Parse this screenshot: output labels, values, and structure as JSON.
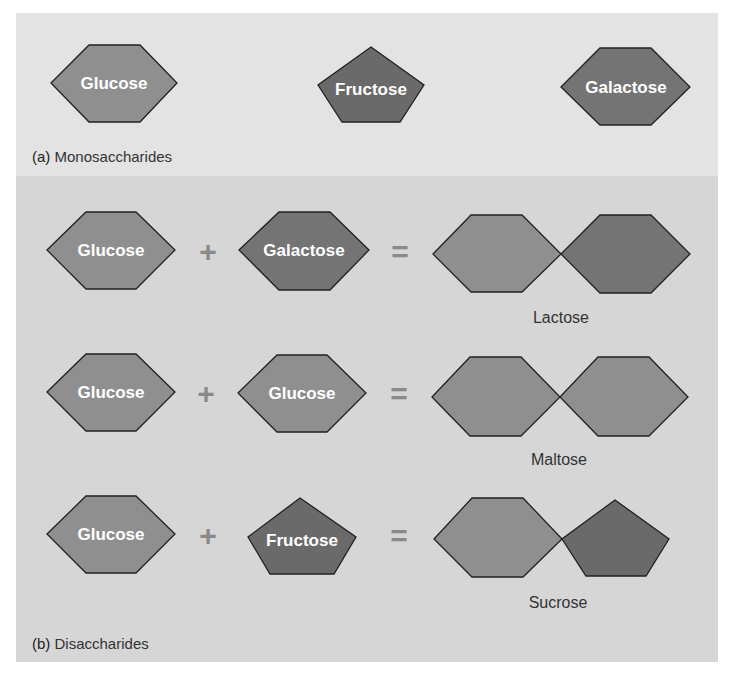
{
  "colors": {
    "panel_a_bg": "#e3e3e3",
    "panel_b_bg": "#d6d6d6",
    "glucose": "#8f8f8f",
    "fructose": "#6a6a6a",
    "galactose": "#747474",
    "operator": "#8a8a8a",
    "outline": "#222222",
    "label_text": "#ffffff"
  },
  "panel_a": {
    "caption_letter": "(a)",
    "caption": "Monosaccharides",
    "molecules": [
      {
        "name": "Glucose",
        "shape": "hexagon"
      },
      {
        "name": "Fructose",
        "shape": "pentagon"
      },
      {
        "name": "Galactose",
        "shape": "hexagon"
      }
    ]
  },
  "panel_b": {
    "caption_letter": "(b)",
    "caption": "Disaccharides",
    "reactions": [
      {
        "left": "Glucose",
        "op": "+",
        "right": "Galactose",
        "eq": "=",
        "product": "Lactose"
      },
      {
        "left": "Glucose",
        "op": "+",
        "right": "Glucose",
        "eq": "=",
        "product": "Maltose"
      },
      {
        "left": "Glucose",
        "op": "+",
        "right": "Fructose",
        "eq": "=",
        "product": "Sucrose"
      }
    ]
  }
}
